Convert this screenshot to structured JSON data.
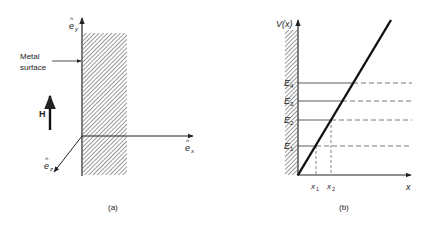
{
  "panel_a": {
    "caption": "(a)",
    "metal_label_line1": "Metal",
    "metal_label_line2": "surface",
    "field_label": "H",
    "axis_y_label": "e",
    "axis_y_sub": "y",
    "axis_x_label": "e",
    "axis_x_sub": "x",
    "axis_z_label": "e",
    "axis_z_sub": "z",
    "hat": "^"
  },
  "panel_b": {
    "caption": "(b)",
    "y_axis_label": "V(x)",
    "x_axis_label": "x",
    "energy_levels": [
      {
        "label": "E",
        "sub": "1"
      },
      {
        "label": "E",
        "sub": "2"
      },
      {
        "label": "E",
        "sub": "3"
      },
      {
        "label": "E",
        "sub": "4"
      }
    ],
    "x_markers": [
      {
        "label": "x",
        "sub": "1"
      },
      {
        "label": "x",
        "sub": "2"
      }
    ]
  },
  "colors": {
    "ink": "#222222",
    "background": "#ffffff"
  }
}
